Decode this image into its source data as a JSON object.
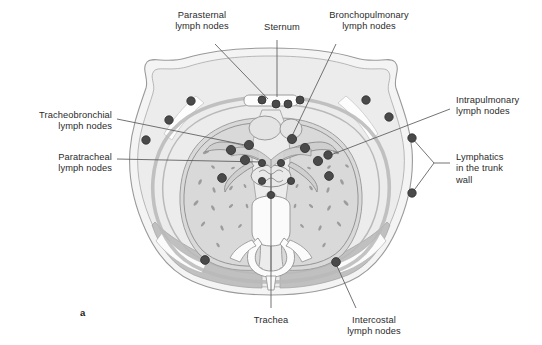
{
  "figure": {
    "panel_label": "a",
    "title_implicit": "Transverse section of the thorax showing lymph nodes and lymphatic drainage",
    "background_color": "#ffffff",
    "ink_color": "#2b2b2b"
  },
  "palette": {
    "node_fill": "#4a4a4a",
    "node_stroke": "#2f2f2f",
    "outline": "#8d8d8d",
    "skin_fill": "#f2f2f2",
    "fat_fill": "#e8e8e8",
    "muscle_fill": "#bdbdbd",
    "lung_fill": "#d8d8d8",
    "mediastinum_fill": "#ebebeb",
    "bone_fill": "#fafafa",
    "vessel_fill": "#c9c9c9",
    "leader_line": "#5a5a5a"
  },
  "labels": [
    {
      "id": "parasternal",
      "text": "Parasternal\nlymph nodes",
      "align": "center",
      "x": 156,
      "y": 10,
      "w": 92
    },
    {
      "id": "sternum",
      "text": "Sternum",
      "align": "center",
      "x": 252,
      "y": 22,
      "w": 60
    },
    {
      "id": "bronchopulmonary",
      "text": "Bronchopulmonary\nlymph nodes",
      "align": "center",
      "x": 314,
      "y": 10,
      "w": 110
    },
    {
      "id": "tracheobronchial",
      "text": "Tracheobronchial\nlymph nodes",
      "align": "right",
      "x": 10,
      "y": 110,
      "w": 102
    },
    {
      "id": "paratracheal",
      "text": "Paratracheal\nlymph nodes",
      "align": "right",
      "x": 10,
      "y": 152,
      "w": 102
    },
    {
      "id": "intrapulmonary",
      "text": "Intrapulmonary\nlymph nodes",
      "align": "left",
      "x": 456,
      "y": 95,
      "w": 88
    },
    {
      "id": "lymphatics_trunk",
      "text": "Lymphatics\nin the trunk\nwall",
      "align": "left",
      "x": 456,
      "y": 152,
      "w": 82
    },
    {
      "id": "trachea",
      "text": "Trachea",
      "align": "center",
      "x": 240,
      "y": 315,
      "w": 62
    },
    {
      "id": "intercostal",
      "text": "Intercostal\nlymph nodes",
      "align": "center",
      "x": 330,
      "y": 315,
      "w": 88
    }
  ],
  "leaders": [
    {
      "id": "leader-parasternal",
      "points": "215,44 268,99"
    },
    {
      "id": "leader-sternum",
      "points": "277,40 277,97"
    },
    {
      "id": "leader-bronchopulmonary",
      "points": "336,44 292,136"
    },
    {
      "id": "leader-tracheobronchial",
      "points": "117,119 250,146"
    },
    {
      "id": "leader-paratracheal",
      "points": "117,159 262,162"
    },
    {
      "id": "leader-intrapulmonary",
      "points": "450,109 328,156"
    },
    {
      "id": "leader-lymphatics-a",
      "points": "450,163 415,138"
    },
    {
      "id": "leader-lymphatics-b",
      "points": "450,163 412,193"
    },
    {
      "id": "leader-trachea",
      "points": "271,310 271,174"
    },
    {
      "id": "leader-intercostal",
      "points": "356,308 336,262"
    }
  ],
  "lymph_nodes": [
    {
      "group": "parasternal",
      "cx": 262,
      "cy": 100,
      "r": 4.0
    },
    {
      "group": "parasternal",
      "cx": 276,
      "cy": 104,
      "r": 4.0
    },
    {
      "group": "parasternal",
      "cx": 288,
      "cy": 104,
      "r": 4.0
    },
    {
      "group": "parasternal",
      "cx": 300,
      "cy": 100,
      "r": 4.0
    },
    {
      "group": "trunk-wall-left",
      "cx": 191,
      "cy": 101,
      "r": 4.2
    },
    {
      "group": "trunk-wall-left",
      "cx": 169,
      "cy": 120,
      "r": 4.2
    },
    {
      "group": "trunk-wall-left",
      "cx": 146,
      "cy": 140,
      "r": 4.2
    },
    {
      "group": "trunk-wall-right",
      "cx": 366,
      "cy": 100,
      "r": 4.2
    },
    {
      "group": "trunk-wall-right",
      "cx": 389,
      "cy": 117,
      "r": 4.2
    },
    {
      "group": "trunk-wall-right",
      "cx": 412,
      "cy": 138,
      "r": 4.2
    },
    {
      "group": "trunk-wall-right",
      "cx": 412,
      "cy": 193,
      "r": 4.2
    },
    {
      "group": "tracheobronchial",
      "cx": 249,
      "cy": 145,
      "r": 4.6
    },
    {
      "group": "tracheobronchial",
      "cx": 231,
      "cy": 150,
      "r": 4.6
    },
    {
      "group": "tracheobronchial",
      "cx": 245,
      "cy": 160,
      "r": 4.6
    },
    {
      "group": "tracheobronchial",
      "cx": 305,
      "cy": 148,
      "r": 4.6
    },
    {
      "group": "bronchopulmonary",
      "cx": 292,
      "cy": 139,
      "r": 4.6
    },
    {
      "group": "bronchopulmonary",
      "cx": 318,
      "cy": 161,
      "r": 4.6
    },
    {
      "group": "bronchopulmonary",
      "cx": 328,
      "cy": 155,
      "r": 4.2
    },
    {
      "group": "paratracheal",
      "cx": 262,
      "cy": 163,
      "r": 3.6
    },
    {
      "group": "paratracheal",
      "cx": 281,
      "cy": 163,
      "r": 3.6
    },
    {
      "group": "paratracheal",
      "cx": 262,
      "cy": 181,
      "r": 3.6
    },
    {
      "group": "paratracheal",
      "cx": 291,
      "cy": 181,
      "r": 3.6
    },
    {
      "group": "paratracheal",
      "cx": 271,
      "cy": 195,
      "r": 3.6
    },
    {
      "group": "intrapulmonary",
      "cx": 222,
      "cy": 178,
      "r": 4.4
    },
    {
      "group": "intrapulmonary",
      "cx": 329,
      "cy": 176,
      "r": 4.4
    },
    {
      "group": "intercostal",
      "cx": 336,
      "cy": 262,
      "r": 4.4
    },
    {
      "group": "intercostal",
      "cx": 205,
      "cy": 260,
      "r": 4.4
    }
  ],
  "lung_markings": {
    "description": "small dark dashes representing pulmonary vessels in lung fields",
    "count_left": 17,
    "count_right": 18
  }
}
